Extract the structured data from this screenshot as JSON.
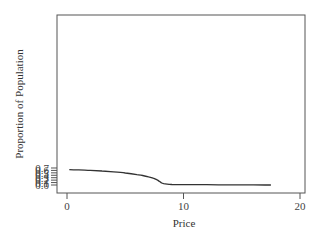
{
  "chart_data": {
    "type": "line",
    "title": "",
    "xlabel": "Price",
    "ylabel": "Proportion of Population",
    "xlim": [
      -0.8,
      20.5
    ],
    "ylim": [
      -0.01,
      0.7
    ],
    "xticks": [
      0,
      10,
      20
    ],
    "xtick_labels": [
      "0",
      "10",
      "20"
    ],
    "yticks": [
      0.0,
      0.1,
      0.2,
      0.3,
      0.4,
      0.5,
      0.6,
      0.7
    ],
    "ytick_labels": [
      "0.0",
      "0.1",
      "0.2",
      "0.3",
      "0.4",
      "0.5",
      "0.6",
      "0.7"
    ],
    "grid": false,
    "legend": null,
    "series": [
      {
        "name": "Proportion of Population",
        "color": "#333333",
        "x": [
          0.2,
          1,
          2,
          3,
          4,
          5,
          6,
          6.5,
          7,
          7.4,
          7.7,
          7.9,
          8.1,
          8.3,
          8.6,
          9.0,
          9.5,
          10,
          11,
          12,
          13,
          14,
          15,
          16,
          17,
          17.5
        ],
        "y": [
          0.632,
          0.62,
          0.6,
          0.575,
          0.54,
          0.495,
          0.43,
          0.39,
          0.335,
          0.28,
          0.22,
          0.16,
          0.09,
          0.055,
          0.035,
          0.022,
          0.016,
          0.015,
          0.016,
          0.013,
          0.01,
          0.007,
          0.005,
          0.003,
          0.002,
          0.002
        ]
      }
    ]
  }
}
